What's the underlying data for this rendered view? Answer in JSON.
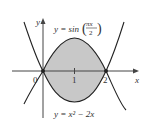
{
  "diagram": {
    "type": "region between curves",
    "curves": [
      {
        "label_prefix": "y = sin",
        "label_frac_num": "πx",
        "label_frac_den": "2",
        "equation": "y = sin(πx/2)"
      },
      {
        "label": "y = x² − 2x",
        "equation": "y = x^2 - 2x"
      }
    ],
    "axes": {
      "x_label": "x",
      "y_label": "y"
    },
    "ticks": {
      "origin": "0",
      "one": "1",
      "two": "2"
    },
    "shaded_region": {
      "from": 0,
      "to": 2,
      "fill": "#c8c8c8"
    },
    "colors": {
      "curve": "#222222",
      "axis": "#444444",
      "fill": "#c8c8c8"
    }
  }
}
